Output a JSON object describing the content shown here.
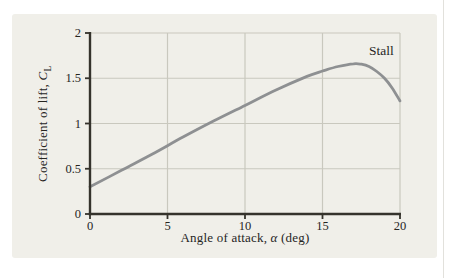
{
  "chart_data": {
    "type": "line",
    "title": "",
    "xlabel": "Angle of attack, α (deg)",
    "ylabel": "Coefficient of lift, C_L",
    "xlabel_parts": {
      "pre": "Angle of attack, ",
      "symbol": "α",
      "post": " (deg)"
    },
    "ylabel_parts": {
      "pre": "Coefficient of lift, ",
      "symbol": "C",
      "subscript": "L"
    },
    "xlim": [
      0,
      20
    ],
    "ylim": [
      0,
      2
    ],
    "xticks": [
      0,
      5,
      10,
      15,
      20
    ],
    "xtick_labels": [
      "0",
      "5",
      "10",
      "15",
      "20"
    ],
    "yticks": [
      0,
      0.5,
      1,
      1.5,
      2
    ],
    "ytick_labels": [
      "0",
      "0.5",
      "1",
      "1.5",
      "2"
    ],
    "grid": true,
    "legend": "none",
    "series": [
      {
        "name": "lift-curve",
        "x": [
          0,
          2,
          4,
          6,
          8,
          10,
          12,
          14,
          15,
          16,
          17,
          17.5,
          18,
          18.5,
          19,
          19.5,
          20
        ],
        "y": [
          0.3,
          0.48,
          0.66,
          0.85,
          1.03,
          1.2,
          1.37,
          1.52,
          1.58,
          1.63,
          1.66,
          1.655,
          1.63,
          1.575,
          1.5,
          1.39,
          1.25
        ]
      }
    ],
    "annotations": [
      {
        "text": "Stall",
        "x": 18.8,
        "y": 1.8
      }
    ],
    "peak": {
      "x": 17,
      "y": 1.66
    },
    "colors": {
      "panel_bg": "#f0efe9",
      "grid": "#c9c8be",
      "axis": "#35332c",
      "curve": "#8e9092",
      "text": "#26251f"
    }
  }
}
